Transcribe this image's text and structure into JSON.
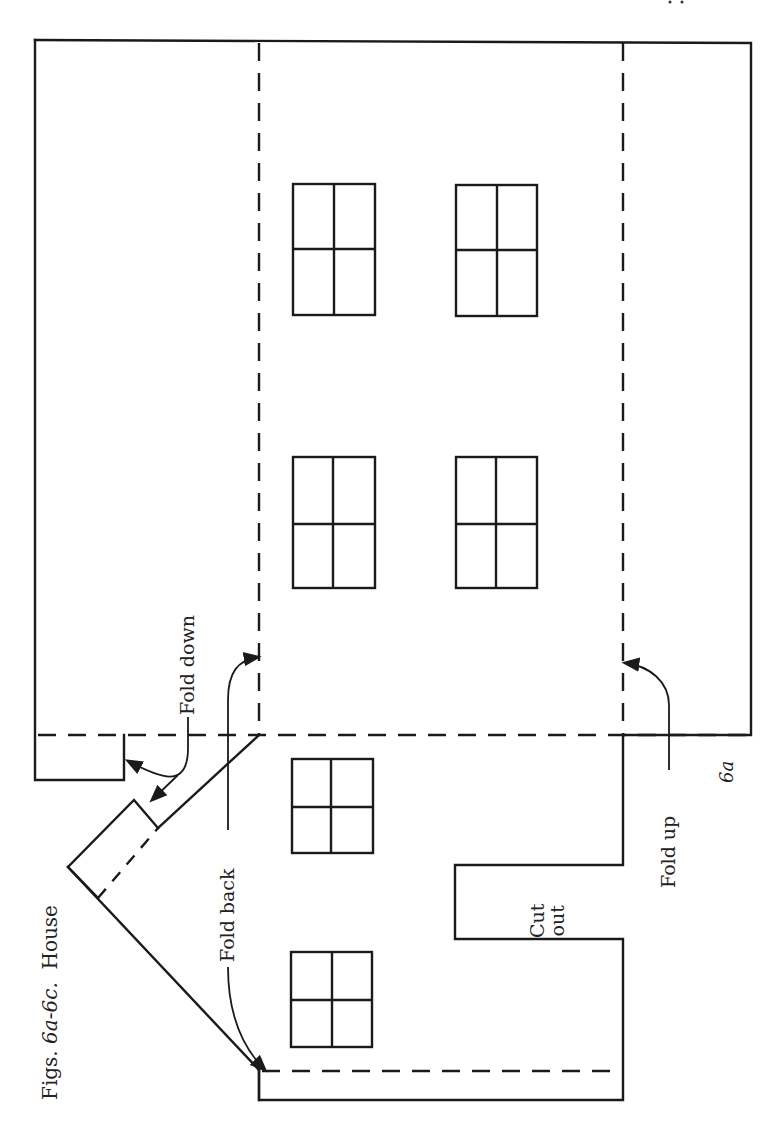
{
  "figure": {
    "caption_prefix": "Figs. ",
    "caption_range": "6a-6c.",
    "caption_title": "House",
    "figure_number": "6a"
  },
  "labels": {
    "fold_down": "Fold down",
    "fold_back": "Fold back",
    "fold_up": "Fold up",
    "cut_out_line1": "Cut",
    "cut_out_line2": "out"
  },
  "windows": [
    {
      "id": "upper-left",
      "x": 293,
      "y": 184,
      "w": 82,
      "h": 131
    },
    {
      "id": "upper-right",
      "x": 456,
      "y": 185,
      "w": 81,
      "h": 131
    },
    {
      "id": "middle-left",
      "x": 293,
      "y": 457,
      "w": 82,
      "h": 131
    },
    {
      "id": "middle-right",
      "x": 456,
      "y": 457,
      "w": 81,
      "h": 131
    },
    {
      "id": "lower-small",
      "x": 292,
      "y": 759,
      "w": 81,
      "h": 94
    },
    {
      "id": "bottom",
      "x": 291,
      "y": 952,
      "w": 81,
      "h": 95
    }
  ],
  "colors": {
    "ink": "#1a1a1a",
    "paper": "#ffffff"
  }
}
